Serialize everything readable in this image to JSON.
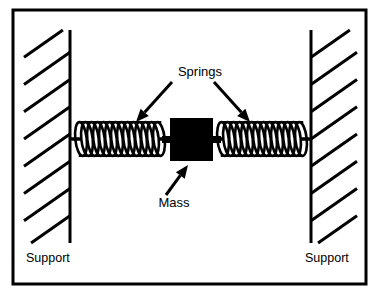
{
  "figure": {
    "type": "mechanical-schematic",
    "width": 380,
    "height": 296,
    "background_color": "#ffffff",
    "ink_color": "#000000",
    "border": {
      "name": "figure-border",
      "x": 13,
      "y": 10,
      "width": 353,
      "height": 274,
      "stroke_width": 3,
      "color": "#000000"
    }
  },
  "labels": {
    "springs": "Springs",
    "mass": "Mass",
    "support_left": "Support",
    "support_right": "Support"
  },
  "components": {
    "support_left": {
      "name": "left-support",
      "wall_x": 70,
      "wall_top": 30,
      "wall_bottom": 243,
      "hatch_side": "left",
      "hatch_count": 9,
      "hatch_angle_deg": 55,
      "label_x": 26,
      "label_y": 262
    },
    "support_right": {
      "name": "right-support",
      "wall_x": 311,
      "wall_top": 30,
      "wall_bottom": 243,
      "hatch_side": "right",
      "hatch_count": 9,
      "hatch_angle_deg": 55,
      "label_x": 305,
      "label_y": 262
    },
    "spring_left": {
      "name": "left-spring",
      "x_start": 74,
      "x_end": 166,
      "center_y": 139,
      "coil_count": 13,
      "amplitude": 17
    },
    "spring_right": {
      "name": "right-spring",
      "x_start": 216,
      "x_end": 308,
      "center_y": 139,
      "coil_count": 13,
      "amplitude": 17
    },
    "mass": {
      "name": "mass-block",
      "x": 170,
      "y": 118,
      "width": 43,
      "height": 43,
      "fill": "#000000",
      "tab_width": 8,
      "tab_height": 7
    }
  },
  "annotations": {
    "springs_label": {
      "text_x": 200,
      "text_y": 76,
      "anchor": "middle"
    },
    "arrow_to_left_spring": {
      "name": "springs-arrow-left",
      "x1": 172,
      "y1": 82,
      "x2": 136,
      "y2": 122
    },
    "arrow_to_right_spring": {
      "name": "springs-arrow-right",
      "x1": 214,
      "y1": 82,
      "x2": 250,
      "y2": 122
    },
    "mass_label": {
      "text_x": 174,
      "text_y": 207,
      "anchor": "middle"
    },
    "arrow_to_mass": {
      "name": "mass-arrow",
      "x1": 166,
      "y1": 195,
      "x2": 188,
      "y2": 165
    }
  }
}
